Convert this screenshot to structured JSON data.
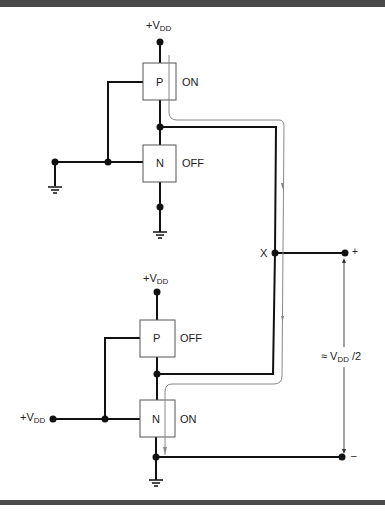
{
  "diagram": {
    "colors": {
      "wire": "#111111",
      "current_path": "#888888",
      "box_border": "#555555",
      "frame_bar": "#4a4a4a"
    },
    "top_stage": {
      "supply_label": "+V",
      "supply_sub": "DD",
      "pmos": {
        "label": "P",
        "state": "ON"
      },
      "nmos": {
        "label": "N",
        "state": "OFF"
      }
    },
    "bottom_stage": {
      "supply_label": "+V",
      "supply_sub": "DD",
      "input_label": "+V",
      "input_sub": "DD",
      "pmos": {
        "label": "P",
        "state": "OFF"
      },
      "nmos": {
        "label": "N",
        "state": "ON"
      }
    },
    "output": {
      "node_label": "X",
      "plus_label": "+",
      "minus_label": "–",
      "voltage_prefix": "≈ V",
      "voltage_sub": "DD",
      "voltage_suffix": " /2"
    }
  }
}
